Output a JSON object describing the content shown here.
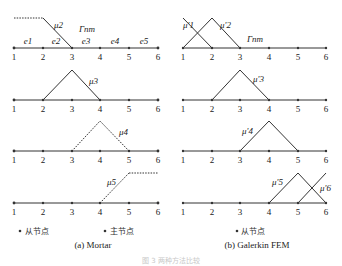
{
  "panels": {
    "left": {
      "caption": "(a) Mortar",
      "legend": {
        "slave": "从节点",
        "master": "主节点"
      },
      "gamma_label": "Γnm",
      "element_labels": [
        "e1",
        "e2",
        "e3",
        "e4",
        "e5"
      ],
      "node_labels": [
        "1",
        "2",
        "3",
        "4",
        "5",
        "6"
      ],
      "rows": [
        {
          "label": "μ2",
          "shape": "dashed-flat-then-down"
        },
        {
          "label": "μ3",
          "shape": "hat-2-3-4"
        },
        {
          "label": "μ4",
          "shape": "hat-3-4-5"
        },
        {
          "label": "μ5",
          "shape": "up-then-dashed-flat"
        }
      ]
    },
    "right": {
      "caption": "(b) Galerkin FEM",
      "legend": {
        "slave": "从节点"
      },
      "gamma_label": "Γnm",
      "node_labels": [
        "1",
        "2",
        "3",
        "4",
        "5",
        "6"
      ],
      "rows": [
        {
          "labels": [
            "μ'1",
            "μ'2"
          ],
          "shape": "half-hat-1 + hat-1-2-3"
        },
        {
          "label": "μ'3",
          "shape": "hat-2-3-4"
        },
        {
          "label": "μ'4",
          "shape": "hat-3-4-5"
        },
        {
          "labels": [
            "μ'5",
            "μ'6"
          ],
          "shape": "hat-4-5-6 + half-hat-6"
        }
      ]
    }
  },
  "figure_caption": "图 3  两种方法比较"
}
